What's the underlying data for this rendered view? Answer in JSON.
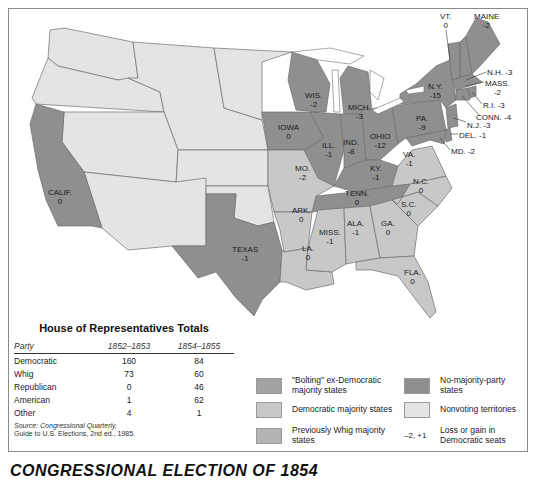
{
  "map": {
    "colors": {
      "bolting_ex_democratic": "#a3a3a3",
      "democratic_majority": "#c8c8c8",
      "previously_whig": "#b4b4b4",
      "no_majority_party": "#8f8f8f",
      "nonvoting_territories": "#e4e4e4",
      "water": "#ffffff",
      "border": "#6e6e6e"
    },
    "states": [
      {
        "name": "CALIF.",
        "value": "0",
        "category": "no_majority_party"
      },
      {
        "name": "TEXAS",
        "value": "-1",
        "category": "no_majority_party"
      },
      {
        "name": "IOWA",
        "value": "0",
        "category": "no_majority_party"
      },
      {
        "name": "WIS.",
        "value": "-2",
        "category": "no_majority_party"
      },
      {
        "name": "MICH.",
        "value": "-3",
        "category": "no_majority_party"
      },
      {
        "name": "ILL.",
        "value": "-1",
        "category": "no_majority_party"
      },
      {
        "name": "IND.",
        "value": "-8",
        "category": "no_majority_party"
      },
      {
        "name": "OHIO",
        "value": "-12",
        "category": "no_majority_party"
      },
      {
        "name": "MO.",
        "value": "-2",
        "category": "democratic_majority"
      },
      {
        "name": "KY.",
        "value": "-1",
        "category": "no_majority_party"
      },
      {
        "name": "TENN.",
        "value": "0",
        "category": "no_majority_party"
      },
      {
        "name": "ARK.",
        "value": "0",
        "category": "democratic_majority"
      },
      {
        "name": "LA.",
        "value": "0",
        "category": "democratic_majority"
      },
      {
        "name": "MISS.",
        "value": "-1",
        "category": "democratic_majority"
      },
      {
        "name": "ALA.",
        "value": "-1",
        "category": "democratic_majority"
      },
      {
        "name": "GA.",
        "value": "0",
        "category": "democratic_majority"
      },
      {
        "name": "FLA.",
        "value": "0",
        "category": "democratic_majority"
      },
      {
        "name": "S.C.",
        "value": "0",
        "category": "democratic_majority"
      },
      {
        "name": "N.C.",
        "value": "0",
        "category": "democratic_majority"
      },
      {
        "name": "VA.",
        "value": "-1",
        "category": "democratic_majority"
      },
      {
        "name": "PA.",
        "value": "-9",
        "category": "no_majority_party"
      },
      {
        "name": "N.Y.",
        "value": "-15",
        "category": "no_majority_party"
      },
      {
        "name": "VT.",
        "value": "0",
        "category": "no_majority_party"
      },
      {
        "name": "MAINE",
        "value": "-2",
        "category": "no_majority_party"
      },
      {
        "name": "N.H.",
        "value": "-3",
        "category": "no_majority_party"
      },
      {
        "name": "MASS.",
        "value": "-2",
        "category": "no_majority_party"
      },
      {
        "name": "R.I.",
        "value": "-3",
        "category": "no_majority_party"
      },
      {
        "name": "CONN.",
        "value": "-4",
        "category": "no_majority_party"
      },
      {
        "name": "N.J.",
        "value": "-3",
        "category": "no_majority_party"
      },
      {
        "name": "DEL.",
        "value": "-1",
        "category": "no_majority_party"
      },
      {
        "name": "MD.",
        "value": "-2",
        "category": "no_majority_party"
      }
    ]
  },
  "labels": {
    "calif": {
      "name": "CALIF.",
      "value": "0"
    },
    "texas": {
      "name": "TEXAS",
      "value": "-1"
    },
    "iowa": {
      "name": "IOWA",
      "value": "0"
    },
    "wis": {
      "name": "WIS.",
      "value": "-2"
    },
    "mich": {
      "name": "MICH.",
      "value": "-3"
    },
    "ill": {
      "name": "ILL.",
      "value": "-1"
    },
    "ind": {
      "name": "IND.",
      "value": "-8"
    },
    "ohio": {
      "name": "OHIO",
      "value": "-12"
    },
    "mo": {
      "name": "MO.",
      "value": "-2"
    },
    "ky": {
      "name": "KY.",
      "value": "-1"
    },
    "tenn": {
      "name": "TENN.",
      "value": "0"
    },
    "ark": {
      "name": "ARK.",
      "value": "0"
    },
    "la": {
      "name": "LA.",
      "value": "0"
    },
    "miss": {
      "name": "MISS.",
      "value": "-1"
    },
    "ala": {
      "name": "ALA.",
      "value": "-1"
    },
    "ga": {
      "name": "GA.",
      "value": "0"
    },
    "fla": {
      "name": "FLA.",
      "value": "0"
    },
    "sc": {
      "name": "S.C.",
      "value": "0"
    },
    "nc": {
      "name": "N.C.",
      "value": "0"
    },
    "va": {
      "name": "VA.",
      "value": "-1"
    },
    "pa": {
      "name": "PA.",
      "value": "-9"
    },
    "ny": {
      "name": "N.Y.",
      "value": "-15"
    },
    "vt": {
      "name": "VT.",
      "value": "0"
    },
    "maine": {
      "name": "MAINE",
      "value": "-2"
    },
    "nh": "N.H. -3",
    "mass": {
      "name": "MASS.",
      "value": "-2"
    },
    "ri": "R.I. -3",
    "conn": "CONN. -4",
    "nj": "N.J. -3",
    "del": "DEL. -1",
    "md": "MD. -2"
  },
  "totals_table": {
    "title": "House of Representatives Totals",
    "headers": [
      "Party",
      "1852–1853",
      "1854–1855"
    ],
    "rows": [
      [
        "Democratic",
        "160",
        "84"
      ],
      [
        "Whig",
        "73",
        "60"
      ],
      [
        "Republican",
        "0",
        "46"
      ],
      [
        "American",
        "1",
        "62"
      ],
      [
        "Other",
        "4",
        "1"
      ]
    ],
    "source_line1": "Source: Congressional Quarterly,",
    "source_line2": "Guide to U.S. Elections, 2nd ed., 1985."
  },
  "legend": {
    "bolting": "\"Bolting\" ex-Democratic majority states",
    "democratic": "Democratic majority states",
    "whig": "Previously Whig majority states",
    "no_majority": "No-majority-party states",
    "nonvoting": "Nonvoting territories",
    "change_symbol": "–2, +1",
    "change_text": "Loss or gain in Democratic seats"
  },
  "figure_title": "CONGRESSIONAL ELECTION OF 1854"
}
